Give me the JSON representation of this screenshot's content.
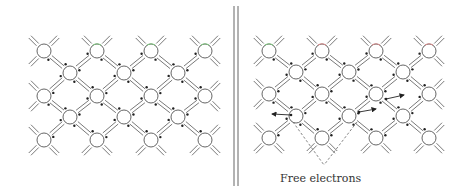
{
  "figure": {
    "divider": "double vertical line",
    "colors": {
      "stroke": "#555555",
      "electron": "#222222",
      "green_atom_tint": "#7ec87e",
      "red_atom_tint": "#d98a8a",
      "background": "#ffffff"
    }
  },
  "left_panel": {
    "name": "intact-lattice",
    "rows": [
      {
        "y": 51,
        "x": [
          44,
          97,
          151,
          205
        ]
      },
      {
        "y": 73,
        "x": [
          70,
          124,
          178
        ]
      },
      {
        "y": 96,
        "x": [
          44,
          97,
          151,
          205
        ]
      },
      {
        "y": 117,
        "x": [
          70,
          124,
          178
        ]
      },
      {
        "y": 140,
        "x": [
          44,
          97,
          151,
          205
        ]
      }
    ],
    "tinted_atoms": [
      {
        "row": 0,
        "col": 1,
        "tint": "green"
      },
      {
        "row": 0,
        "col": 2,
        "tint": "green"
      },
      {
        "row": 0,
        "col": 3,
        "tint": "green"
      }
    ]
  },
  "right_panel": {
    "name": "lattice-with-free-electrons",
    "rows": [
      {
        "y": 51,
        "x": [
          269,
          322,
          376,
          429
        ]
      },
      {
        "y": 72,
        "x": [
          296,
          349,
          403
        ]
      },
      {
        "y": 94,
        "x": [
          269,
          322,
          376,
          429
        ]
      },
      {
        "y": 116,
        "x": [
          296,
          349,
          403
        ]
      },
      {
        "y": 138,
        "x": [
          269,
          322,
          376,
          429
        ]
      }
    ],
    "tinted_atoms": [
      {
        "row": 0,
        "col": 0,
        "tint": "green"
      },
      {
        "row": 0,
        "col": 1,
        "tint": "red"
      },
      {
        "row": 0,
        "col": 2,
        "tint": "red"
      },
      {
        "row": 0,
        "col": 3,
        "tint": "red"
      }
    ],
    "free_electrons": [
      {
        "x1": 291,
        "y1": 115,
        "x2": 272,
        "y2": 114
      },
      {
        "x1": 359,
        "y1": 112,
        "x2": 376,
        "y2": 109
      },
      {
        "x1": 386,
        "y1": 99,
        "x2": 404,
        "y2": 95
      }
    ],
    "callout": {
      "lines": [
        {
          "x1": 293,
          "y1": 122,
          "x2": 324,
          "y2": 165
        },
        {
          "x1": 357,
          "y1": 122,
          "x2": 324,
          "y2": 165
        }
      ],
      "label": "Free electrons"
    }
  }
}
